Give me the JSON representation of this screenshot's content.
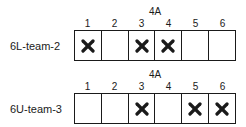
{
  "groups": [
    {
      "title": "4A",
      "row_label": "6L-team-2",
      "columns": [
        "1",
        "2",
        "3",
        "4",
        "5",
        "6"
      ],
      "marked": [
        true,
        false,
        true,
        true,
        false,
        false
      ]
    },
    {
      "title": "4A",
      "row_label": "6U-team-3",
      "columns": [
        "1",
        "2",
        "3",
        "4",
        "5",
        "6"
      ],
      "marked": [
        false,
        false,
        true,
        false,
        true,
        true
      ]
    }
  ],
  "mark_icon": "x-mark-icon"
}
